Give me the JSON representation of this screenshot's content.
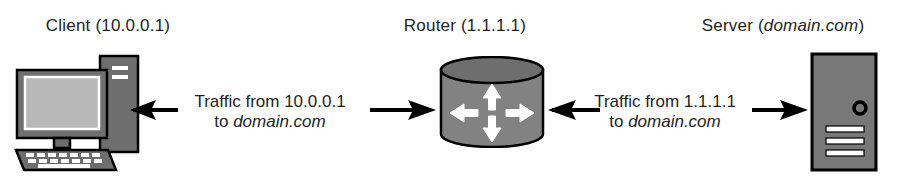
{
  "diagram": {
    "type": "network-traffic-flow",
    "background_color": "#ffffff",
    "stroke_color": "#000000",
    "device_fill": "#808080",
    "device_fill_dark": "#6e6e6e",
    "device_highlight": "#ffffff",
    "nodes": [
      {
        "id": "client",
        "icon": "desktop-computer-icon",
        "label": "Client (10.0.0.1)",
        "name": "Client",
        "address": "10.0.0.1"
      },
      {
        "id": "router",
        "icon": "router-cylinder-icon",
        "label": "Router (1.1.1.1)",
        "name": "Router",
        "address": "1.1.1.1"
      },
      {
        "id": "server",
        "icon": "server-tower-icon",
        "label": "Server (domain.com)",
        "name": "Server",
        "address": "domain.com",
        "address_italic": true
      }
    ],
    "flows": [
      {
        "id": "client-router-flow",
        "line1": "Traffic from 10.0.0.1",
        "line2_prefix": "to ",
        "line2_em": "domain.com",
        "source": "10.0.0.1",
        "destination": "domain.com",
        "between": [
          "client",
          "router"
        ]
      },
      {
        "id": "router-server-flow",
        "line1": "Traffic from 1.1.1.1",
        "line2_prefix": "to ",
        "line2_em": "domain.com",
        "source": "1.1.1.1",
        "destination": "domain.com",
        "between": [
          "router",
          "server"
        ]
      }
    ],
    "arrows": [
      {
        "id": "arrow-to-client",
        "direction": "left",
        "name": "arrow-to-client"
      },
      {
        "id": "arrow-to-router-left",
        "direction": "right",
        "name": "arrow-to-router-left"
      },
      {
        "id": "arrow-to-router-right",
        "direction": "left",
        "name": "arrow-to-router-right"
      },
      {
        "id": "arrow-to-server",
        "direction": "right",
        "name": "arrow-to-server"
      }
    ]
  }
}
